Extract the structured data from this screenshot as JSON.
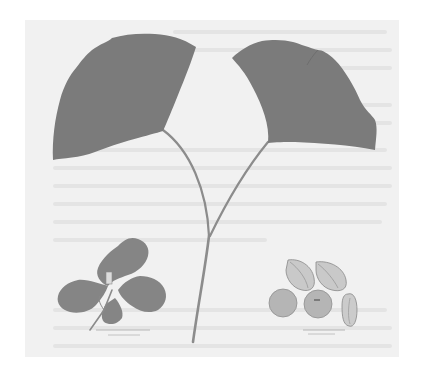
{
  "plate": {
    "subject": "Ginkgo biloba botanical illustration",
    "background_color": "#f1f1f1",
    "page_color": "#ffffff"
  },
  "figures": [
    {
      "name": "left-leaf",
      "color": "#7b7b7b"
    },
    {
      "name": "right-leaf",
      "color": "#7b7b7b"
    },
    {
      "name": "stem",
      "color": "#8a8a8a"
    },
    {
      "name": "leaf-sprig",
      "color": "#858585"
    },
    {
      "name": "seeds",
      "count": 5,
      "color": "#b5b5b5"
    }
  ],
  "captions": {
    "sprig": "",
    "seeds": ""
  }
}
